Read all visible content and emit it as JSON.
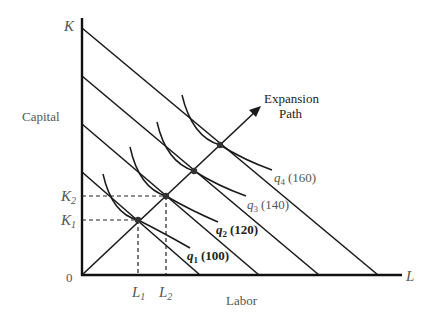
{
  "diagram": {
    "type": "expansion-path",
    "y_axis": {
      "label": "Capital",
      "symbol": "K"
    },
    "x_axis": {
      "label": "Labor",
      "symbol": "L"
    },
    "origin_label": "0",
    "expansion_path_label_line1": "Expansion",
    "expansion_path_label_line2": "Path",
    "ticks": {
      "K1": {
        "base": "K",
        "sub": "1"
      },
      "K2": {
        "base": "K",
        "sub": "2"
      },
      "L1": {
        "base": "L",
        "sub": "1"
      },
      "L2": {
        "base": "L",
        "sub": "2"
      }
    },
    "isoquants": [
      {
        "id": "q1",
        "base": "q",
        "sub": "1",
        "value": "(100)"
      },
      {
        "id": "q2",
        "base": "q",
        "sub": "2",
        "value": "(120)"
      },
      {
        "id": "q3",
        "base": "q",
        "sub": "3",
        "value": "(140)"
      },
      {
        "id": "q4",
        "base": "q",
        "sub": "4",
        "value": "(160)"
      }
    ],
    "isocost_lines_count": 4,
    "tangency_points_count": 4
  }
}
